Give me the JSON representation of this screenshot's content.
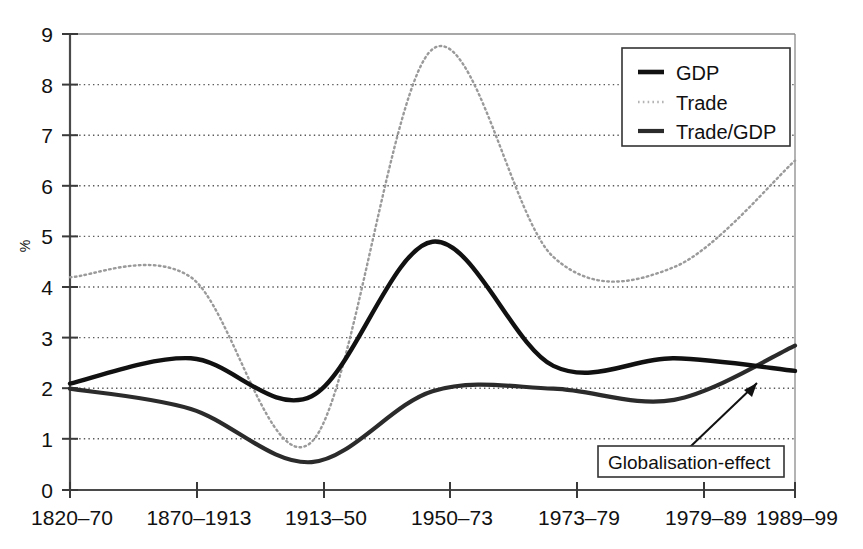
{
  "chart_data": {
    "type": "line",
    "title": "",
    "xlabel": "",
    "ylabel": "%",
    "ylim": [
      0,
      9
    ],
    "yticks": [
      0,
      1,
      2,
      3,
      4,
      5,
      6,
      7,
      8,
      9
    ],
    "ytick_labels": [
      "0",
      "1",
      "2",
      "3",
      "4",
      "5",
      "6",
      "7",
      "8",
      "9"
    ],
    "grid": true,
    "grid_axis": "y",
    "legend_position": "top-right",
    "categories": [
      "1820–70",
      "1870–1913",
      "1913–50",
      "1950–73",
      "1973–79",
      "1979–89",
      "1989–99"
    ],
    "series": [
      {
        "name": "GDP",
        "style": "solid-thick",
        "color": "#111111",
        "values": [
          2.1,
          2.6,
          1.85,
          4.9,
          2.45,
          2.6,
          2.35
        ]
      },
      {
        "name": "Trade",
        "style": "dotted",
        "color": "#9a9a9a",
        "values": [
          4.2,
          4.2,
          0.95,
          8.7,
          4.6,
          4.4,
          6.5
        ]
      },
      {
        "name": "Trade/GDP",
        "style": "solid-medium",
        "color": "#2b2b2b",
        "values": [
          2.0,
          1.6,
          0.55,
          1.95,
          2.0,
          1.78,
          2.85
        ]
      }
    ],
    "annotations": [
      {
        "text": "Globalisation-effect",
        "points_to_category": "1989–99",
        "points_to_value": 2.45
      }
    ]
  },
  "legend": {
    "entries": [
      {
        "label": "GDP",
        "swatch": "solid-thick-line-icon"
      },
      {
        "label": "Trade",
        "swatch": "dotted-line-icon"
      },
      {
        "label": "Trade/GDP",
        "swatch": "solid-medium-line-icon"
      }
    ]
  },
  "axes": {
    "y_label": "%",
    "y_ticks": [
      "0",
      "1",
      "2",
      "3",
      "4",
      "5",
      "6",
      "7",
      "8",
      "9"
    ],
    "x_ticks": [
      "1820–70",
      "1870–1913",
      "1913–50",
      "1950–73",
      "1973–79",
      "1979–89",
      "1989–99"
    ]
  },
  "annotation": {
    "label": "Globalisation-effect"
  },
  "colors": {
    "gdp": "#111111",
    "trade": "#9a9a9a",
    "trade_gdp": "#2b2b2b",
    "grid": "#5a5a5a",
    "axis": "#4a4a4a",
    "background": "#ffffff"
  }
}
